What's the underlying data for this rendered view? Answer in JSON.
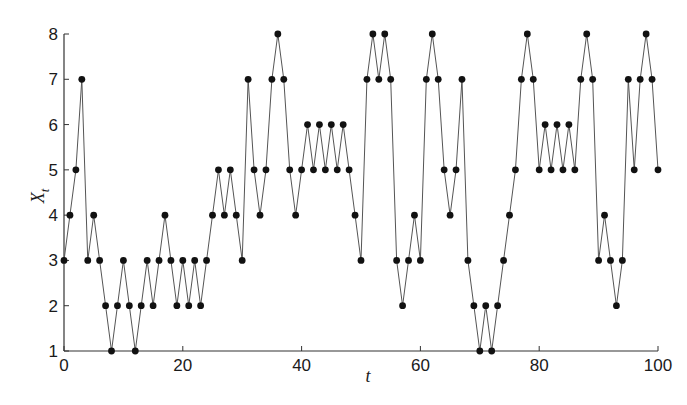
{
  "chart_data": {
    "type": "line",
    "title": "",
    "xlabel": "t",
    "ylabel": "X_t",
    "xlim": [
      0,
      100
    ],
    "ylim": [
      1,
      8
    ],
    "xticks": [
      0,
      20,
      40,
      60,
      80,
      100
    ],
    "yticks": [
      1,
      2,
      3,
      4,
      5,
      6,
      7,
      8
    ],
    "grid": false,
    "legend": null,
    "markers": "filled-circle",
    "line_color": "#555555",
    "marker_color": "#111111",
    "x": [
      0,
      1,
      2,
      3,
      4,
      5,
      6,
      7,
      8,
      9,
      10,
      11,
      12,
      13,
      14,
      15,
      16,
      17,
      18,
      19,
      20,
      21,
      22,
      23,
      24,
      25,
      26,
      27,
      28,
      29,
      30,
      31,
      32,
      33,
      34,
      35,
      36,
      37,
      38,
      39,
      40,
      41,
      42,
      43,
      44,
      45,
      46,
      47,
      48,
      49,
      50,
      51,
      52,
      53,
      54,
      55,
      56,
      57,
      58,
      59,
      60,
      61,
      62,
      63,
      64,
      65,
      66,
      67,
      68,
      69,
      70,
      71,
      72,
      73,
      74,
      75,
      76,
      77,
      78,
      79,
      80,
      81,
      82,
      83,
      84,
      85,
      86,
      87,
      88,
      89,
      90,
      91,
      92,
      93,
      94,
      95,
      96,
      97,
      98,
      99,
      100
    ],
    "values": [
      3,
      4,
      5,
      7,
      3,
      4,
      3,
      2,
      1,
      2,
      3,
      2,
      1,
      2,
      3,
      2,
      3,
      4,
      3,
      2,
      3,
      2,
      3,
      2,
      3,
      4,
      5,
      4,
      5,
      4,
      3,
      7,
      5,
      4,
      5,
      7,
      8,
      7,
      5,
      4,
      5,
      6,
      5,
      6,
      5,
      6,
      5,
      6,
      5,
      4,
      3,
      7,
      8,
      7,
      8,
      7,
      3,
      2,
      3,
      4,
      3,
      7,
      8,
      7,
      5,
      4,
      5,
      7,
      3,
      2,
      1,
      2,
      1,
      2,
      3,
      4,
      5,
      7,
      8,
      7,
      5,
      6,
      5,
      6,
      5,
      6,
      5,
      7,
      8,
      7,
      3,
      4,
      3,
      2,
      3,
      7,
      5,
      7,
      8,
      7,
      5
    ]
  }
}
